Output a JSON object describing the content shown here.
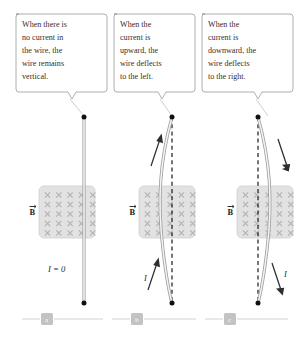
{
  "figure": {
    "background": "#ffffff"
  },
  "colors": {
    "callout_border": "#9a9a9a",
    "callout_text": "#3a2b2b",
    "field_panel": "#e2e2e2",
    "x_mark": "#b4b4b4",
    "wire": "#9e9e9e",
    "terminal": "#111111",
    "dashed_reference": "#111111",
    "arrow": "#2e2e2e",
    "chip": "#c3c3c3",
    "rule": "#d2d2d2"
  },
  "panels": [
    {
      "id": "a",
      "chip_label": "a",
      "callout": "When there is no current in the wire, the wire remains vertical.",
      "callout_lines": [
        "When there is",
        "no current in",
        "the wire, the",
        "wire remains",
        "vertical."
      ],
      "field_label": "B",
      "current_label": "I = 0",
      "wire_state": "vertical",
      "has_dashed_reference": false,
      "arrows": []
    },
    {
      "id": "b",
      "chip_label": "b",
      "callout": "When the current is upward, the wire deflects to the left.",
      "callout_lines": [
        "When the",
        "current is",
        "upward, the",
        "wire deflects",
        "to the left."
      ],
      "field_label": "B",
      "current_label": "I",
      "wire_state": "deflected-left",
      "has_dashed_reference": true,
      "arrows": [
        {
          "direction": "up",
          "position": "upper"
        },
        {
          "direction": "up",
          "position": "lower",
          "label": "I"
        }
      ]
    },
    {
      "id": "c",
      "chip_label": "c",
      "callout": "When the current is downward, the wire deflects to the right.",
      "callout_lines": [
        "When the",
        "current is",
        "downward, the",
        "wire deflects",
        "to the right."
      ],
      "field_label": "B",
      "current_label": "I",
      "wire_state": "deflected-right",
      "has_dashed_reference": true,
      "arrows": [
        {
          "direction": "down",
          "position": "upper"
        },
        {
          "direction": "down",
          "position": "lower",
          "label": "I"
        }
      ]
    }
  ],
  "field_grid": {
    "symbol": "x",
    "rows": 5,
    "cols": 5
  }
}
